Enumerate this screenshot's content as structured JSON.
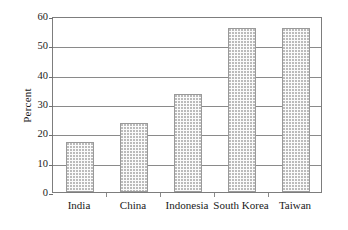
{
  "chart_data": {
    "type": "bar",
    "title": "",
    "xlabel": "",
    "ylabel": "Percent",
    "categories": [
      "India",
      "China",
      "Indonesia",
      "South Korea",
      "Taiwan"
    ],
    "values": [
      17,
      23.5,
      33.5,
      56,
      56
    ],
    "ylim": [
      0,
      60
    ],
    "ytick_labels": [
      "0",
      "10",
      "20",
      "30",
      "40",
      "50",
      "60"
    ],
    "ytick_values": [
      0,
      10,
      20,
      30,
      40,
      50,
      60
    ],
    "grid": "horizontal",
    "legend": "none",
    "series_name": "Percent",
    "bar_fill": "#fbfbfb",
    "bar_dot_color": "#b9b9b9",
    "bar_border_color": "#9a9a9a",
    "axis_color": "#7d7d7d",
    "gridline_color": "#8a8a8a"
  }
}
